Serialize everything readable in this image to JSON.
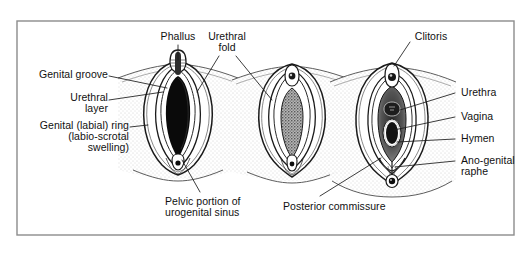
{
  "figure": {
    "panel_count": 3,
    "border_color": "#8c8c8c",
    "background_color": "#ffffff",
    "ink_color": "#111111",
    "stipple_color": "#9a9a9a"
  },
  "labels": {
    "genital_groove": "Genital groove",
    "urethral_layer_line1": "Urethral",
    "urethral_layer_line2": "layer",
    "genital_ring_line1": "Genital (labial) ring",
    "genital_ring_line2": "(labio-scrotal",
    "genital_ring_line3": "swelling)",
    "phallus": "Phallus",
    "urethral_fold_line1": "Urethral",
    "urethral_fold_line2": "fold",
    "clitoris": "Clitoris",
    "urethra": "Urethra",
    "vagina": "Vagina",
    "hymen": "Hymen",
    "ano_genital_raphe_line1": "Ano-genital",
    "ano_genital_raphe_line2": "raphe",
    "pelvic_portion_line1": "Pelvic portion of",
    "pelvic_portion_line2": "urogenital sinus",
    "posterior_commissure": "Posterior commissure"
  },
  "panels": [
    {
      "name": "indifferent-stage",
      "structures": [
        "phallus",
        "genital groove",
        "urethral layer",
        "urethral fold",
        "genital (labial) ring",
        "pelvic portion of urogenital sinus"
      ]
    },
    {
      "name": "intermediate-stage",
      "structures": [
        "urethral fold",
        "genital groove"
      ]
    },
    {
      "name": "female-stage",
      "structures": [
        "clitoris",
        "urethra",
        "vagina",
        "hymen",
        "ano-genital raphe",
        "posterior commissure"
      ]
    }
  ]
}
